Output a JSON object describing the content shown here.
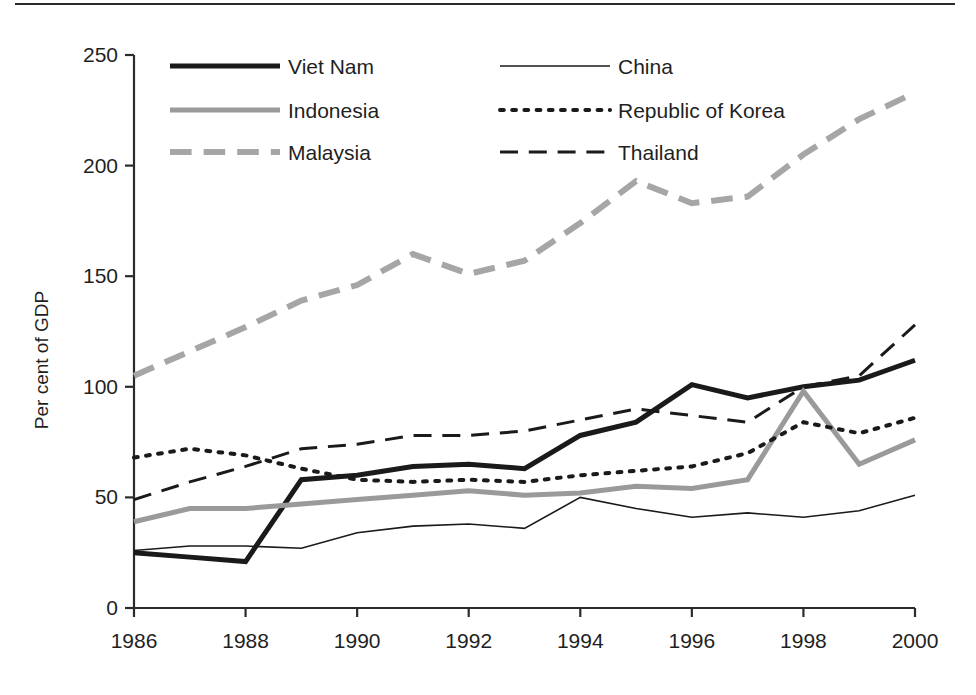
{
  "chart_data": {
    "type": "line",
    "title": "",
    "subtitle": "",
    "xlabel": "",
    "ylabel": "Per cent of GDP",
    "x": [
      1986,
      1987,
      1988,
      1989,
      1990,
      1991,
      1992,
      1993,
      1994,
      1995,
      1996,
      1997,
      1998,
      1999,
      2000
    ],
    "xlim": [
      1986,
      2000
    ],
    "ylim": [
      0,
      250
    ],
    "xticks": [
      1986,
      1988,
      1990,
      1992,
      1994,
      1996,
      1998,
      2000
    ],
    "xtick_labels": [
      "1986",
      "1988",
      "1990",
      "1992",
      "1994",
      "1996",
      "1998",
      "2000"
    ],
    "yticks": [
      0,
      50,
      100,
      150,
      200,
      250
    ],
    "ytick_labels": [
      "0",
      "50",
      "100",
      "150",
      "200",
      "250"
    ],
    "grid": false,
    "legend_position": "top-left-inside",
    "series": [
      {
        "name": "Viet Nam",
        "style": "solid",
        "color": "#1a1a1a",
        "width": 5,
        "values": [
          25,
          23,
          21,
          58,
          60,
          64,
          65,
          63,
          78,
          84,
          101,
          95,
          100,
          103,
          112
        ]
      },
      {
        "name": "China",
        "style": "solid",
        "color": "#1a1a1a",
        "width": 1.6,
        "values": [
          26,
          28,
          28,
          27,
          34,
          37,
          38,
          36,
          50,
          45,
          41,
          43,
          41,
          44,
          51
        ]
      },
      {
        "name": "Indonesia",
        "style": "solid",
        "color": "#9a9a9a",
        "width": 5,
        "values": [
          39,
          45,
          45,
          47,
          49,
          51,
          53,
          51,
          52,
          55,
          54,
          58,
          98,
          65,
          76
        ]
      },
      {
        "name": "Republic of Korea",
        "style": "dotted",
        "color": "#1a1a1a",
        "width": 4,
        "values": [
          68,
          72,
          69,
          63,
          58,
          57,
          58,
          57,
          60,
          62,
          64,
          70,
          84,
          79,
          86
        ]
      },
      {
        "name": "Malaysia",
        "style": "dashed-wide",
        "color": "#a6a6a6",
        "width": 6,
        "values": [
          105,
          116,
          127,
          139,
          146,
          160,
          151,
          157,
          174,
          193,
          183,
          186,
          205,
          221,
          233
        ]
      },
      {
        "name": "Thailand",
        "style": "dashed",
        "color": "#1a1a1a",
        "width": 3,
        "values": [
          49,
          57,
          64,
          72,
          74,
          78,
          78,
          80,
          85,
          90,
          87,
          84,
          100,
          105,
          128
        ]
      }
    ]
  },
  "legend": {
    "entries": [
      {
        "label": "Viet Nam"
      },
      {
        "label": "China"
      },
      {
        "label": "Indonesia"
      },
      {
        "label": "Republic of Korea"
      },
      {
        "label": "Malaysia"
      },
      {
        "label": "Thailand"
      }
    ]
  }
}
